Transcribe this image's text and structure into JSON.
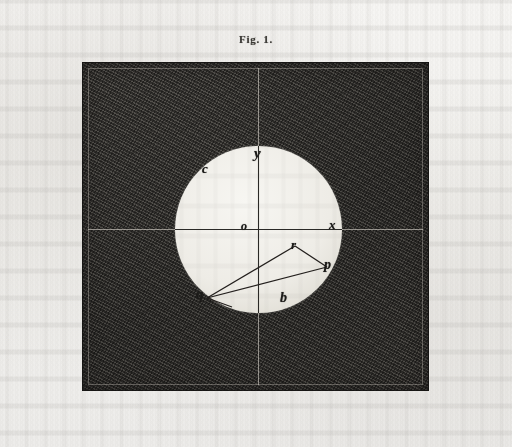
{
  "page": {
    "medium": "engraved-plate-scan",
    "paper_color": "#f2f1ef",
    "ink_color": "#1b1a18"
  },
  "figure": {
    "caption": "Fig. 1.",
    "plate": {
      "field_color": "#3b3a37",
      "disc_color": "#efece6",
      "axis_color": "#d6d2ca",
      "keyline_color": "#c4c0b9"
    },
    "axes": [
      {
        "name": "vertical-axis",
        "orientation": "vertical"
      },
      {
        "name": "horizontal-axis",
        "orientation": "horizontal"
      }
    ],
    "labels": [
      {
        "id": "y",
        "text": "y",
        "position": "disc-top",
        "on_axis": "vertical"
      },
      {
        "id": "c",
        "text": "c",
        "position": "disc-upper-left",
        "on_axis": ""
      },
      {
        "id": "o",
        "text": "o",
        "position": "disc-center",
        "on_axis": "both"
      },
      {
        "id": "x",
        "text": "x",
        "position": "disc-right",
        "on_axis": "horizontal"
      },
      {
        "id": "r",
        "text": "r",
        "position": "triangle-apex",
        "on_axis": ""
      },
      {
        "id": "p",
        "text": "p",
        "position": "triangle-right",
        "on_axis": ""
      },
      {
        "id": "q",
        "text": "q",
        "position": "triangle-left",
        "on_axis": ""
      },
      {
        "id": "b",
        "text": "b",
        "position": "disc-bottom",
        "on_axis": ""
      }
    ],
    "triangle": {
      "name": "triangle-qrp",
      "vertices": [
        "q",
        "r",
        "p"
      ],
      "edges": [
        {
          "from": "q",
          "to": "r"
        },
        {
          "from": "r",
          "to": "p"
        },
        {
          "from": "p",
          "to": "q"
        }
      ]
    }
  }
}
